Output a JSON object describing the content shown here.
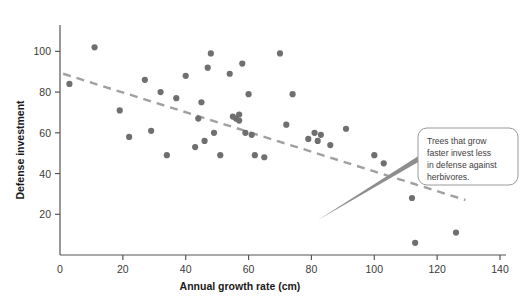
{
  "chart_data": {
    "type": "scatter",
    "title": "",
    "xlabel": "Annual growth rate (cm)",
    "ylabel": "Defense investment",
    "xlim": [
      0,
      140
    ],
    "ylim": [
      0,
      110
    ],
    "xticks": [
      0,
      20,
      40,
      60,
      80,
      100,
      120,
      140
    ],
    "yticks": [
      20,
      40,
      60,
      80,
      100
    ],
    "grid": false,
    "legend": null,
    "point_color": "#6f6f6f",
    "trendline_color": "#a0a0a0",
    "axis_color": "#555555",
    "points": [
      {
        "x": 3,
        "y": 84
      },
      {
        "x": 11,
        "y": 102
      },
      {
        "x": 19,
        "y": 71
      },
      {
        "x": 22,
        "y": 58
      },
      {
        "x": 27,
        "y": 86
      },
      {
        "x": 29,
        "y": 61
      },
      {
        "x": 32,
        "y": 80
      },
      {
        "x": 34,
        "y": 49
      },
      {
        "x": 37,
        "y": 77
      },
      {
        "x": 40,
        "y": 88
      },
      {
        "x": 43,
        "y": 53
      },
      {
        "x": 44,
        "y": 67
      },
      {
        "x": 45,
        "y": 75
      },
      {
        "x": 46,
        "y": 56
      },
      {
        "x": 47,
        "y": 92
      },
      {
        "x": 48,
        "y": 99
      },
      {
        "x": 49,
        "y": 60
      },
      {
        "x": 51,
        "y": 49
      },
      {
        "x": 54,
        "y": 89
      },
      {
        "x": 55,
        "y": 68
      },
      {
        "x": 56,
        "y": 67
      },
      {
        "x": 57,
        "y": 69
      },
      {
        "x": 57,
        "y": 66
      },
      {
        "x": 58,
        "y": 94
      },
      {
        "x": 59,
        "y": 60
      },
      {
        "x": 60,
        "y": 79
      },
      {
        "x": 61,
        "y": 59
      },
      {
        "x": 62,
        "y": 49
      },
      {
        "x": 65,
        "y": 48
      },
      {
        "x": 70,
        "y": 99
      },
      {
        "x": 72,
        "y": 64
      },
      {
        "x": 74,
        "y": 79
      },
      {
        "x": 79,
        "y": 57
      },
      {
        "x": 81,
        "y": 60
      },
      {
        "x": 82,
        "y": 56
      },
      {
        "x": 83,
        "y": 59
      },
      {
        "x": 86,
        "y": 54
      },
      {
        "x": 91,
        "y": 62
      },
      {
        "x": 100,
        "y": 49
      },
      {
        "x": 103,
        "y": 45
      },
      {
        "x": 112,
        "y": 28
      },
      {
        "x": 113,
        "y": 6
      },
      {
        "x": 122,
        "y": 47
      },
      {
        "x": 126,
        "y": 11
      },
      {
        "x": 129,
        "y": 40
      }
    ],
    "trendline": {
      "style": "dashed",
      "x0": 1,
      "y0": 89,
      "x1": 129,
      "y1": 27
    },
    "annotation": {
      "text": "Trees that grow faster invest less in defense against herbivores.",
      "lines": [
        "Trees that grow",
        "faster invest less",
        "in defense against",
        "herbivores."
      ],
      "box_fill": "#ffffff",
      "box_stroke": "#9a9a9a"
    }
  }
}
